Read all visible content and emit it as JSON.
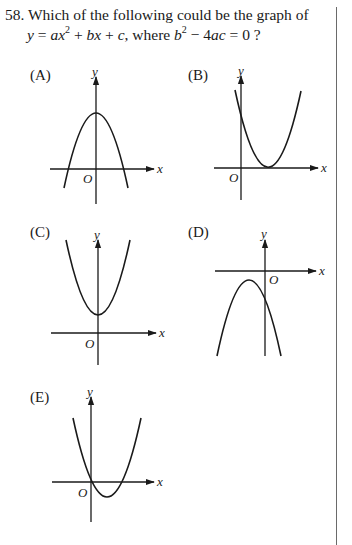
{
  "question": {
    "number": "58.",
    "stem": "Which of the following could be the graph of",
    "equation_prefix": "y = ax",
    "equation_exp": "2",
    "equation_middle": " + bx + c, where b",
    "condition_exp": "2",
    "condition_suffix": " − 4ac = 0 ?"
  },
  "options": [
    {
      "label": "(A)",
      "description": "downward parabola, vertex on positive y-axis, two x-intercepts"
    },
    {
      "label": "(B)",
      "description": "upward parabola tangent to positive x-axis"
    },
    {
      "label": "(C)",
      "description": "upward parabola, vertex on positive y-axis, no x-intercepts"
    },
    {
      "label": "(D)",
      "description": "downward parabola, vertex below x-axis left of y-axis"
    },
    {
      "label": "(E)",
      "description": "upward parabola through origin, two x-intercepts"
    }
  ],
  "axis_labels": {
    "x": "x",
    "y": "y",
    "origin": "O"
  }
}
